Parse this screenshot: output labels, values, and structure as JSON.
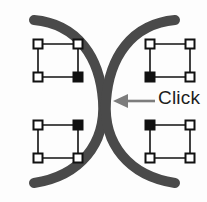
{
  "figure": {
    "name": "curve-intersection-click-illustration",
    "background_color": "#fdfdfd",
    "width": 207,
    "height": 202
  },
  "annotation": {
    "label": "Click",
    "label_color": "#1d1d1d",
    "arrow_color": "#7d7d7d",
    "arrow_direction": "left",
    "arrow_target": "curve-intersection"
  },
  "curves": {
    "color": "#4a4a4a",
    "stroke_width": 10,
    "count": 2,
    "description": "two mirrored arcs pinching at center"
  },
  "handle_style": {
    "size": 9,
    "hollow_fill": "#ffffff",
    "hollow_stroke": "#111111",
    "filled_fill": "#111111",
    "connector_color": "#111111",
    "connector_width": 1.6
  },
  "selection_groups": [
    {
      "name": "top-left",
      "x": 38,
      "y": 44,
      "width": 40,
      "height": 33,
      "anchor_corner": "bottom-right",
      "handles": [
        {
          "corner": "top-left",
          "state": "hollow"
        },
        {
          "corner": "top-right",
          "state": "hollow"
        },
        {
          "corner": "bottom-left",
          "state": "hollow"
        },
        {
          "corner": "bottom-right",
          "state": "filled"
        }
      ]
    },
    {
      "name": "top-right",
      "x": 150,
      "y": 44,
      "width": 40,
      "height": 33,
      "anchor_corner": "bottom-left",
      "handles": [
        {
          "corner": "top-left",
          "state": "hollow"
        },
        {
          "corner": "top-right",
          "state": "hollow"
        },
        {
          "corner": "bottom-left",
          "state": "filled"
        },
        {
          "corner": "bottom-right",
          "state": "hollow"
        }
      ]
    },
    {
      "name": "bottom-left",
      "x": 38,
      "y": 125,
      "width": 40,
      "height": 33,
      "anchor_corner": "top-right",
      "handles": [
        {
          "corner": "top-left",
          "state": "hollow"
        },
        {
          "corner": "top-right",
          "state": "filled"
        },
        {
          "corner": "bottom-left",
          "state": "hollow"
        },
        {
          "corner": "bottom-right",
          "state": "hollow"
        }
      ]
    },
    {
      "name": "bottom-right",
      "x": 150,
      "y": 125,
      "width": 40,
      "height": 33,
      "anchor_corner": "top-left",
      "handles": [
        {
          "corner": "top-left",
          "state": "filled"
        },
        {
          "corner": "top-right",
          "state": "hollow"
        },
        {
          "corner": "bottom-left",
          "state": "hollow"
        },
        {
          "corner": "bottom-right",
          "state": "hollow"
        }
      ]
    }
  ]
}
